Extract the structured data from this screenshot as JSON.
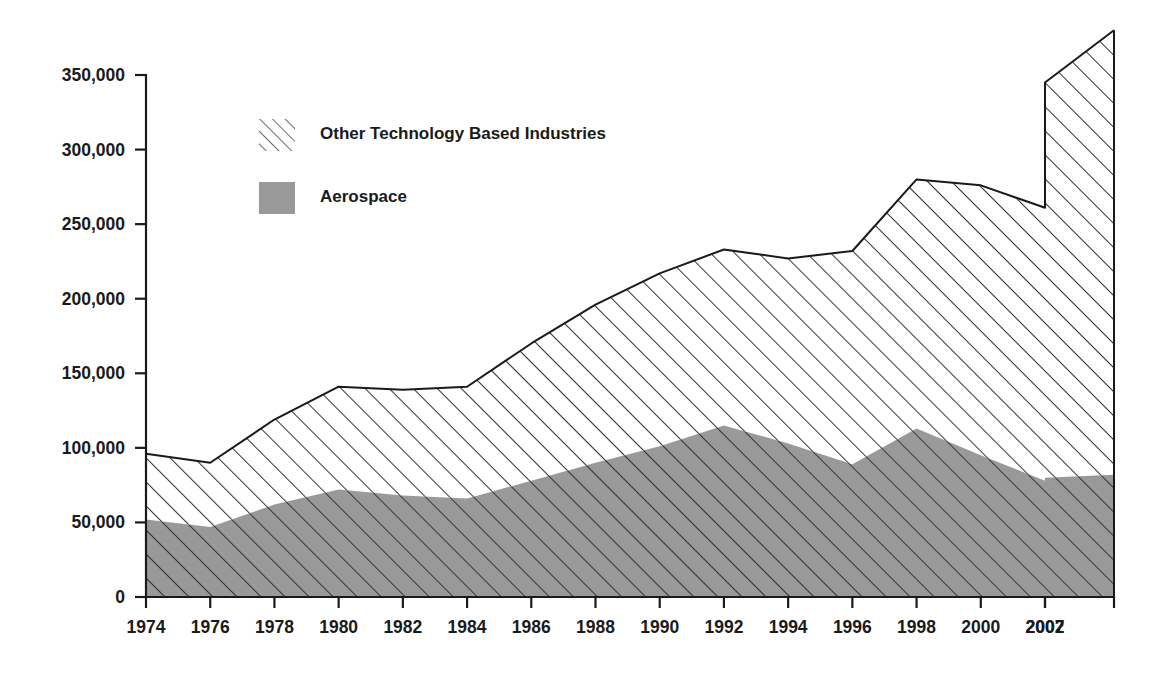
{
  "chart_data": {
    "type": "area",
    "stacked": true,
    "title": "",
    "subtitle": "",
    "xlabel": "",
    "ylabel": "",
    "grid": false,
    "legend_position": "upper-left-inside",
    "xlim": [
      1974,
      2010
    ],
    "ylim": [
      0,
      350000
    ],
    "ytick_values": [
      0,
      50000,
      100000,
      150000,
      200000,
      250000,
      300000,
      350000
    ],
    "ytick_labels": [
      "0",
      "50,000",
      "100,000",
      "150,000",
      "200,000",
      "250,000",
      "300,000",
      "350,000"
    ],
    "xtick_labels": [
      "1974",
      "1976",
      "1978",
      "1980",
      "1982",
      "1984",
      "1986",
      "1988",
      "1990",
      "1992",
      "1994",
      "1996",
      "1998",
      "2000",
      "2002",
      "2007"
    ],
    "xtick_values": [
      1974,
      1976,
      1978,
      1980,
      1982,
      1984,
      1986,
      1988,
      1990,
      1992,
      1994,
      1996,
      1998,
      2000,
      2002,
      2007
    ],
    "x": [
      1974,
      1976,
      1978,
      1980,
      1982,
      1984,
      1986,
      1988,
      1990,
      1992,
      1994,
      1996,
      1998,
      2000,
      2002,
      2007,
      2010
    ],
    "series": [
      {
        "name": "Aerospace",
        "fill": "#999999",
        "pattern": "solid-gray",
        "values": [
          52000,
          47000,
          62000,
          72000,
          68000,
          66000,
          78000,
          90000,
          101000,
          115000,
          103000,
          89000,
          113000,
          95000,
          78000,
          80000,
          82000
        ]
      },
      {
        "name": "Other Technology Based Industries",
        "fill": "#ffffff",
        "pattern": "diagonal-hatch",
        "values": [
          44000,
          43000,
          57000,
          69000,
          71000,
          75000,
          92000,
          106000,
          116000,
          118000,
          124000,
          143000,
          167000,
          181000,
          183000,
          265000,
          298000
        ]
      }
    ],
    "totals": [
      96000,
      90000,
      119000,
      141000,
      139000,
      141000,
      170000,
      196000,
      217000,
      233000,
      227000,
      232000,
      280000,
      276000,
      261000,
      345000,
      380000
    ]
  },
  "legend": {
    "entries": [
      {
        "label": "Other Technology Based Industries",
        "swatch": "hatch-swatch"
      },
      {
        "label": "Aerospace",
        "swatch": "gray-swatch"
      }
    ]
  },
  "axes": {
    "y_tick_labels": [
      "350,000",
      "300,000",
      "250,000",
      "200,000",
      "150,000",
      "100,000",
      "50,000",
      "0"
    ],
    "x_tick_labels": [
      "1974",
      "1976",
      "1978",
      "1980",
      "1982",
      "1984",
      "1986",
      "1988",
      "1990",
      "1992",
      "1994",
      "1996",
      "1998",
      "2000",
      "2002",
      "2007"
    ]
  },
  "colors": {
    "aerospace_fill": "#999999",
    "hatch_stroke": "#333333",
    "axis": "#1a1a1a",
    "background": "#ffffff"
  }
}
